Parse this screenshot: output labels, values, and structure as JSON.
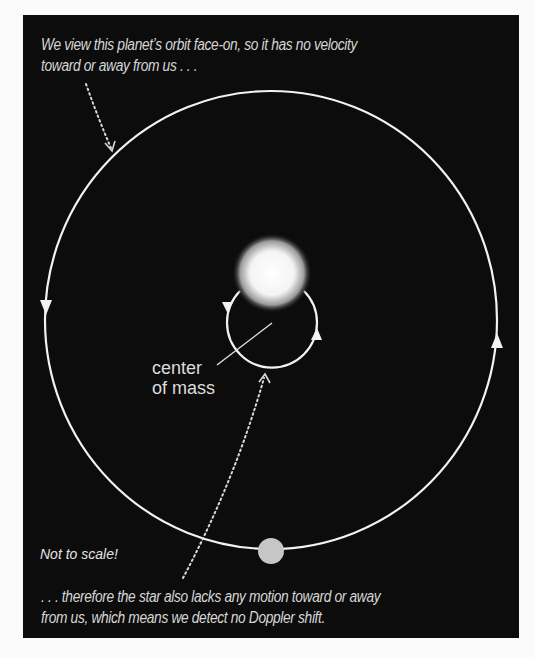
{
  "diagram": {
    "caption_top": {
      "line1": "We view this planet’s orbit face-on, so it has no velocity",
      "line2": "toward or away from us . . ."
    },
    "caption_bottom": {
      "line1": ". . . therefore the star also lacks any motion toward or away",
      "line2": "from us, which means we detect no Doppler shift."
    },
    "center_of_mass_label": {
      "line1": "center",
      "line2": "of mass"
    },
    "note": "Not to scale!",
    "colors": {
      "background": "#0c0c0c",
      "orbit_line": "#f2f2f2",
      "planet": "#c6c6c6",
      "star": "#ffffff",
      "text": "#d6d6d6"
    },
    "elements": {
      "star": {
        "cx": 272,
        "cy": 273,
        "r": 32
      },
      "star_orbit": {
        "cx": 272,
        "cy": 322,
        "r": 45
      },
      "planet": {
        "cx": 271,
        "cy": 551,
        "r": 13
      },
      "planet_orbit": {
        "cx": 271,
        "cy": 320,
        "rx": 226,
        "ry": 229
      }
    }
  }
}
